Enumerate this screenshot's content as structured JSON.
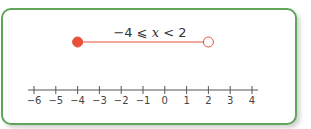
{
  "inequality": {
    "text_left": "−4 ⩽ ",
    "variable": "x",
    "text_right": " < 2",
    "lower": -4,
    "lower_closed": true,
    "upper": 2,
    "upper_closed": false
  },
  "number_line": {
    "min": -6,
    "max": 4,
    "ticks": [
      "−6",
      "−5",
      "−4",
      "−3",
      "−2",
      "−1",
      "0",
      "1",
      "2",
      "3",
      "4"
    ]
  },
  "colors": {
    "border": "#5fa55a",
    "interval": "#e8503a",
    "axis": "#555555"
  }
}
